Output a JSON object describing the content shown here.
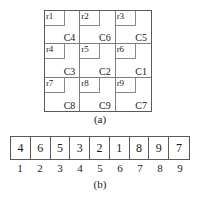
{
  "figure": {
    "panel_a": {
      "caption": "(a)",
      "rows": [
        [
          {
            "r_label": "r1",
            "c_label": "C4"
          },
          {
            "r_label": "r2",
            "c_label": "C6"
          },
          {
            "r_label": "r3",
            "c_label": "C5"
          }
        ],
        [
          {
            "r_label": "r4",
            "c_label": "C3"
          },
          {
            "r_label": "r5",
            "c_label": "C2"
          },
          {
            "r_label": "r6",
            "c_label": "C1"
          }
        ],
        [
          {
            "r_label": "r7",
            "c_label": "C8"
          },
          {
            "r_label": "r8",
            "c_label": "C9"
          },
          {
            "r_label": "r9",
            "c_label": "C7"
          }
        ]
      ]
    },
    "panel_b": {
      "caption": "(b)",
      "values": [
        "4",
        "6",
        "5",
        "3",
        "2",
        "1",
        "8",
        "9",
        "7"
      ],
      "indices": [
        "1",
        "2",
        "3",
        "4",
        "5",
        "6",
        "7",
        "8",
        "9"
      ]
    }
  },
  "colors": {
    "background": "#ffffff",
    "outer_border": "#5a5a5a",
    "inner_border": "#7d7d7d",
    "text": "#1a1a1a"
  }
}
